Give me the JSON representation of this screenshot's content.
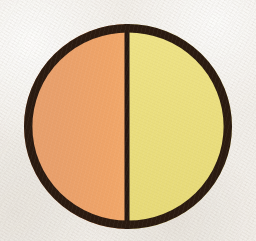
{
  "figure": {
    "canvas": {
      "width": 256,
      "height": 241,
      "background_color": "#f1eee9",
      "texture": "paper-grain"
    },
    "shape": {
      "type": "circle",
      "name": "divided-circle",
      "center_x": 128,
      "center_y": 126.5,
      "radius_x": 104,
      "radius_y": 102.5,
      "outline_color": "#2a1a10",
      "outline_width": 8
    },
    "divider": {
      "name": "vertical-divider",
      "orientation": "vertical",
      "x": 127,
      "width": 5,
      "color": "#241711"
    },
    "halves": [
      {
        "name": "left-half",
        "position": "left",
        "label": "Orange half",
        "color": "#e9a06b",
        "color_edge": "#f2a86a"
      },
      {
        "name": "right-half",
        "position": "right",
        "label": "Yellow half",
        "color": "#ead e7e",
        "color_hex": "#eade7e",
        "color_edge": "#efe489"
      }
    ]
  },
  "chart_data": {
    "type": "pie",
    "labels": [
      "Orange half",
      "Yellow half"
    ],
    "values": [
      50,
      50
    ],
    "colors": [
      "#e9a06b",
      "#eade7e"
    ],
    "start_angle": 90,
    "legend": "none",
    "grid": false,
    "outline_color": "#2a1a10",
    "outline_width": 8,
    "divider_color": "#241711"
  }
}
